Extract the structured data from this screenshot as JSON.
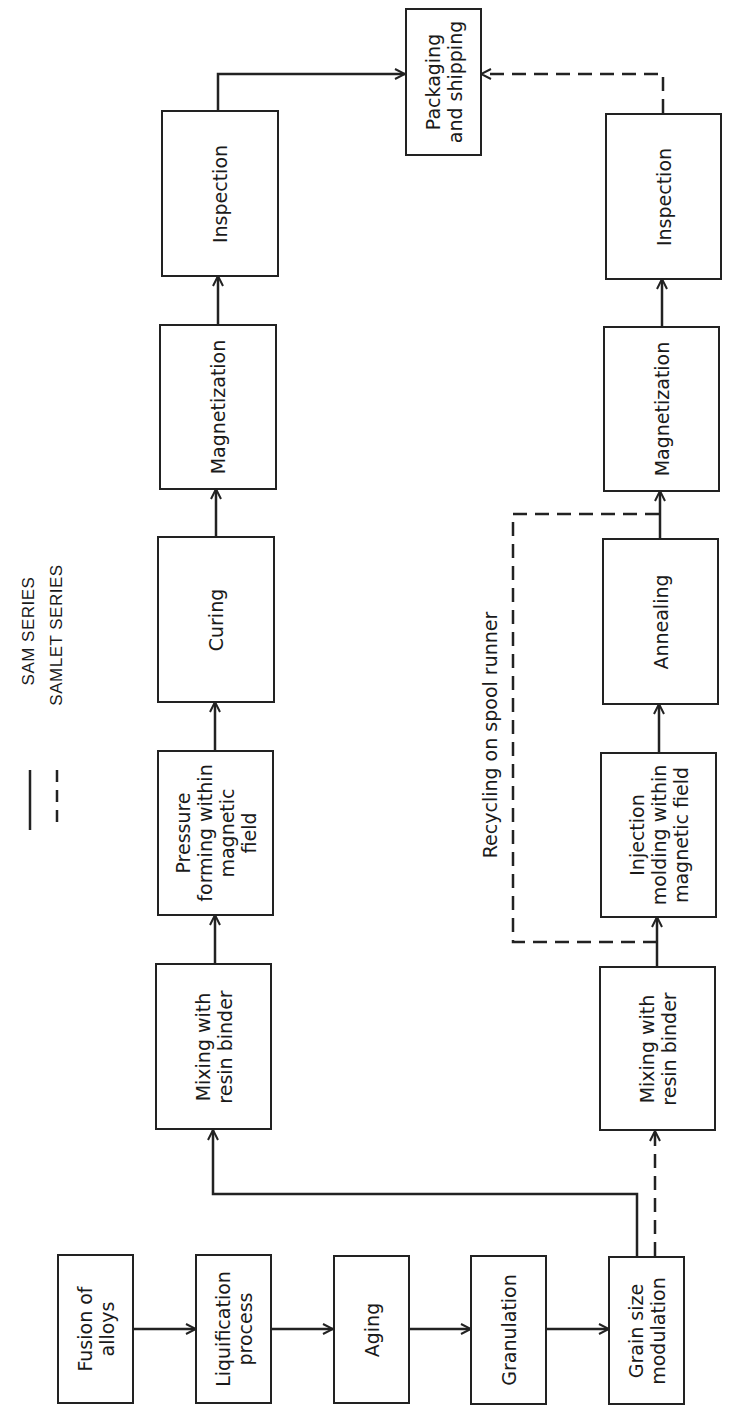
{
  "legend": {
    "solid_label": "SAM SERIES",
    "dashed_label": "SAMLET SERIES"
  },
  "annotation": {
    "recycling": "Recycling on spool runner"
  },
  "common_steps": [
    {
      "id": "fusion",
      "label": "Fusion of\nalloys"
    },
    {
      "id": "liquification",
      "label": "Liquification\nprocess"
    },
    {
      "id": "aging",
      "label": "Aging"
    },
    {
      "id": "granulation",
      "label": "Granulation"
    },
    {
      "id": "grain",
      "label": "Grain size\nmodulation"
    }
  ],
  "sam_series": [
    {
      "id": "sam-mixing",
      "label": "Mixing with\nresin binder"
    },
    {
      "id": "sam-pressure",
      "label": "Pressure\nforming within\nmagnetic\nfield"
    },
    {
      "id": "sam-curing",
      "label": "Curing"
    },
    {
      "id": "sam-magnetization",
      "label": "Magnetization"
    },
    {
      "id": "sam-inspection",
      "label": "Inspection"
    }
  ],
  "samlet_series": [
    {
      "id": "samlet-mixing",
      "label": "Mixing with\nresin binder"
    },
    {
      "id": "samlet-injection",
      "label": "Injection\nmolding within\nmagnetic field"
    },
    {
      "id": "samlet-annealing",
      "label": "Annealing"
    },
    {
      "id": "samlet-magnetization",
      "label": "Magnetization"
    },
    {
      "id": "samlet-inspection",
      "label": "Inspection"
    }
  ],
  "final_step": {
    "id": "packaging",
    "label": "Packaging\nand shipping"
  },
  "colors": {
    "line": "#222222",
    "background": "#ffffff"
  }
}
